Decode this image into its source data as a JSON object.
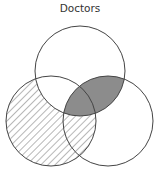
{
  "title": "Doctors",
  "colors": {
    "stroke": "#444444",
    "shaded": "#8c8c8c",
    "hatch": "#6f6f6f",
    "background": "#ffffff"
  },
  "diagram": {
    "type": "venn",
    "sets": [
      {
        "id": "top",
        "cx": 80,
        "cy": 71,
        "r": 45
      },
      {
        "id": "left",
        "cx": 51,
        "cy": 121,
        "r": 45
      },
      {
        "id": "right",
        "cx": 108,
        "cy": 121,
        "r": 45
      }
    ],
    "regions": [
      {
        "description": "left minus top",
        "fill": "hatched"
      },
      {
        "description": "top intersect right",
        "fill": "solid-gray"
      }
    ]
  }
}
